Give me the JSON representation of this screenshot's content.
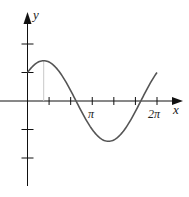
{
  "chart_data": {
    "type": "line",
    "title": "",
    "xlabel": "x",
    "ylabel": "y",
    "x_ticks": [
      "",
      "",
      "π",
      "",
      "",
      "2π"
    ],
    "x_tick_values": [
      1.0472,
      2.0944,
      3.1416,
      4.1888,
      5.236,
      6.2832
    ],
    "y_ticks": [
      -2,
      -1,
      1,
      2
    ],
    "xlim": [
      0,
      6.2832
    ],
    "ylim": [
      -2.5,
      3
    ],
    "grid": false,
    "legend": null,
    "series": [
      {
        "name": "y = sin x + cos x",
        "x": [
          0,
          0.7854,
          1.5708,
          2.3562,
          3.1416,
          3.927,
          4.7124,
          5.4978,
          6.2832
        ],
        "y": [
          1,
          1.414,
          1,
          0,
          -1,
          -1.414,
          -1,
          0,
          1
        ],
        "color": "#555555"
      }
    ],
    "annotations": [
      {
        "type": "vertical-line",
        "x": 0.7854,
        "from_y": 0,
        "to_y": 1.414,
        "color": "#c8c8c8"
      }
    ]
  },
  "labels": {
    "x_axis": "x",
    "y_axis": "y",
    "pi": "π",
    "two_pi": "2π"
  },
  "colors": {
    "axis": "#111111",
    "curve": "#555555",
    "guide": "#c8c8c8"
  }
}
